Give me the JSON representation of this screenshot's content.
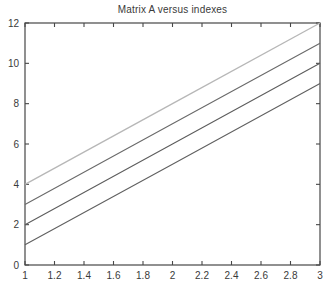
{
  "figure": {
    "title": "Matrix A versus indexes"
  },
  "chart_data": {
    "type": "line",
    "title": "Matrix A versus indexes",
    "x": [
      1,
      2,
      3
    ],
    "series": [
      {
        "name": "A-column-1",
        "values": [
          1,
          5,
          9
        ],
        "color": "#606060",
        "width": 1.1
      },
      {
        "name": "A-column-2",
        "values": [
          2,
          6,
          10
        ],
        "color": "#5d5d5d",
        "width": 1.1
      },
      {
        "name": "A-column-3",
        "values": [
          3,
          7,
          11
        ],
        "color": "#6a6a6a",
        "width": 1.1
      },
      {
        "name": "A-column-4",
        "values": [
          4,
          8,
          12
        ],
        "color": "#b7b7b7",
        "width": 1.3
      }
    ],
    "xlabel": "",
    "ylabel": "",
    "xlim": [
      1,
      3
    ],
    "ylim": [
      0,
      12
    ],
    "xticks": [
      1,
      1.2,
      1.4,
      1.6,
      1.8,
      2,
      2.2,
      2.4,
      2.6,
      2.8,
      3
    ],
    "xtick_labels": [
      "1",
      "1.2",
      "1.4",
      "1.6",
      "1.8",
      "2",
      "2.2",
      "2.4",
      "2.6",
      "2.8",
      "3"
    ],
    "yticks": [
      0,
      2,
      4,
      6,
      8,
      10,
      12
    ],
    "ytick_labels": [
      "0",
      "2",
      "4",
      "6",
      "8",
      "10",
      "12"
    ],
    "grid": false,
    "legend": false,
    "box": true,
    "tick_length": 4,
    "axis_color": "#474747",
    "tick_label_color": "#3a3a3a",
    "background": "#ffffff"
  }
}
